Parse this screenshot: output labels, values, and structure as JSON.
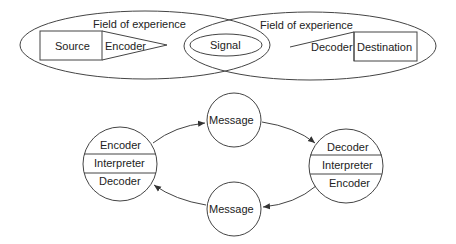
{
  "top_model": {
    "left_field": "Field of experience",
    "right_field": "Field of experience",
    "source": "Source",
    "encoder": "Encoder",
    "signal": "Signal",
    "decoder": "Decoder",
    "destination": "Destination"
  },
  "bottom_model": {
    "left_node": [
      "Encoder",
      "Interpreter",
      "Decoder"
    ],
    "right_node": [
      "Decoder",
      "Interpreter",
      "Encoder"
    ],
    "top_message": "Message",
    "bottom_message": "Message"
  }
}
